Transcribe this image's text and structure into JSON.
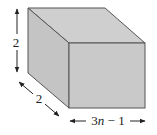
{
  "figure": {
    "type": "rectangular box (cuboid)",
    "labels": {
      "height": "2",
      "depth": "2",
      "width_prefix": "3",
      "width_var": "n",
      "width_suffix": " − 1"
    },
    "colors": {
      "face_fill": "#c9c9c9",
      "top_fill": "#cfcfcf",
      "side_fill": "#c4c4c4",
      "edge": "#555555",
      "arrow": "#222222"
    }
  }
}
